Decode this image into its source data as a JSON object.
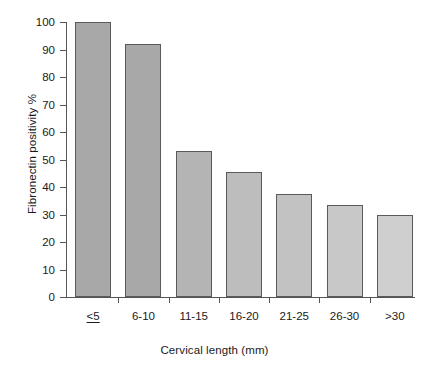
{
  "chart_data": {
    "type": "bar",
    "title": "",
    "xlabel": "Cervical length (mm)",
    "ylabel": "Fibronectin positivity %",
    "categories": [
      "≤5",
      "6-10",
      "11-15",
      "16-20",
      "21-25",
      "26-30",
      ">30"
    ],
    "values": [
      100,
      92,
      53,
      45.5,
      37.5,
      33.5,
      30
    ],
    "ylim": [
      0,
      100
    ],
    "ytick_labels": [
      "0",
      "10",
      "20",
      "30",
      "40",
      "50",
      "60",
      "70",
      "80",
      "90",
      "100"
    ],
    "ytick_values": [
      0,
      10,
      20,
      30,
      40,
      50,
      60,
      70,
      80,
      90,
      100
    ],
    "grid": false,
    "legend": null,
    "bar_colors": [
      "#a8a8a8",
      "#a8a8a8",
      "#b4b4b4",
      "#bdbdbd",
      "#c2c2c2",
      "#c8c8c8",
      "#cfcfcf"
    ],
    "bar_border_color": "#5a5a5a",
    "axis_color": "#555555",
    "background_color": "#ffffff"
  }
}
